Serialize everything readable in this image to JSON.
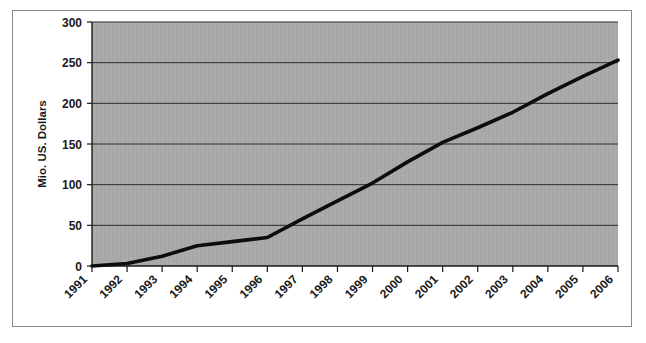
{
  "figure": {
    "background_color": "#ffffff",
    "border_color": "#8a8a8a",
    "plot_background_color": "#a8a8a8",
    "line_color": "#0d0d0d",
    "gridline_color": "#2b2b2b"
  },
  "chart_data": {
    "type": "line",
    "title": "",
    "subtitle": "",
    "xlabel": "",
    "ylabel": "Mio. US. Dollars",
    "categories": [
      "1991",
      "1992",
      "1993",
      "1994",
      "1995",
      "1996",
      "1997",
      "1998",
      "1999",
      "2000",
      "2001",
      "2002",
      "2003",
      "2004",
      "2005",
      "2006"
    ],
    "values": [
      0,
      3,
      12,
      25,
      30,
      35,
      58,
      80,
      102,
      128,
      152,
      170,
      189,
      212,
      233,
      253
    ],
    "series": [
      {
        "name": "Mio. US. Dollars",
        "values": [
          0,
          3,
          12,
          25,
          30,
          35,
          58,
          80,
          102,
          128,
          152,
          170,
          189,
          212,
          233,
          253
        ]
      }
    ],
    "ylim": [
      0,
      300
    ],
    "yticks": [
      0,
      50,
      100,
      150,
      200,
      250,
      300
    ],
    "ytick_labels": [
      "0",
      "50",
      "100",
      "150",
      "200",
      "250",
      "300"
    ],
    "xtick_labels": [
      "1991",
      "1992",
      "1993",
      "1994",
      "1995",
      "1996",
      "1997",
      "1998",
      "1999",
      "2000",
      "2001",
      "2002",
      "2003",
      "2004",
      "2005",
      "2006"
    ],
    "grid": true,
    "grid_axis": "y",
    "legend": false,
    "legend_position": "none",
    "xtick_label_rotation": -45
  },
  "axes": {
    "y_title": "Mio. US. Dollars"
  }
}
